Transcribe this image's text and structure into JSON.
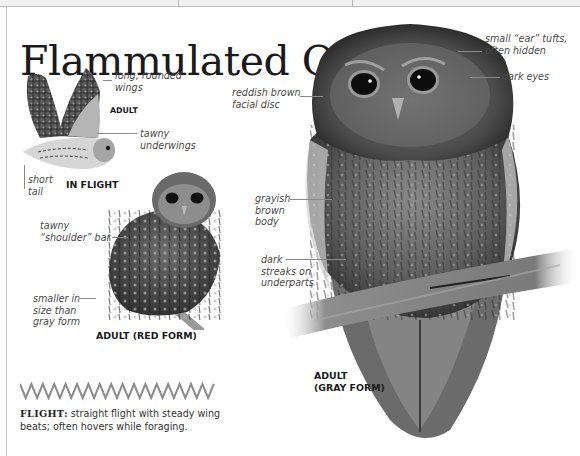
{
  "page": {
    "title": "Flammulated Owl"
  },
  "illustrations": {
    "in_flight": {
      "caption": "IN FLIGHT",
      "age_label": "ADULT",
      "annotations": {
        "wings": "long, rounded\nwings",
        "underwings": "tawny\nunderwings",
        "tail": "short\ntail"
      }
    },
    "red_form": {
      "caption": "ADULT (RED FORM)",
      "annotations": {
        "shoulder": "tawny\n“shoulder” bar",
        "size": "smaller in\nsize than\ngray form"
      }
    },
    "gray_form": {
      "caption": "ADULT\n(GRAY FORM)",
      "annotations": {
        "ear_tufts": "small “ear” tufts,\noften hidden",
        "eyes": "dark eyes",
        "facial_disc": "reddish brown\nfacial disc",
        "body": "grayish\nbrown\nbody",
        "streaks": "dark\nstreaks on\nunderparts"
      }
    }
  },
  "flight_pattern": {
    "icon": "zigzag-flight-path-icon",
    "heading": "FLIGHT:",
    "text": " straight flight with steady wing beats; often hovers while foraging."
  },
  "colors": {
    "title": "#1a1a1a",
    "annotation": "#4a4a4a",
    "leader_line": "#8a8a8a",
    "zigzag": "#8c8c8c"
  }
}
